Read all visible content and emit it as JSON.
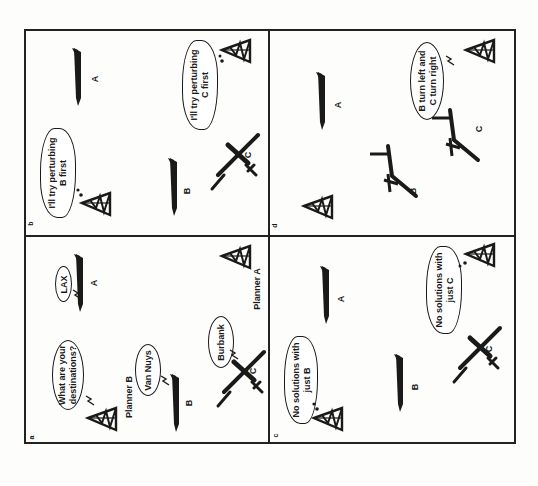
{
  "figure": {
    "orientation": "rotated 90 degrees counter-clockwise",
    "panels": [
      {
        "id": "a",
        "letter": "a",
        "aircraft": [
          {
            "label": "A",
            "pose": "side"
          },
          {
            "label": "B",
            "pose": "side"
          },
          {
            "label": "C",
            "pose": "top"
          }
        ],
        "planners": [
          {
            "label": "Planner B"
          },
          {
            "label": "Planner A"
          }
        ],
        "bubbles": [
          {
            "speaker": "Planner B",
            "text_line1": "What are your",
            "text_line2": "destinations?",
            "shape": "oval"
          },
          {
            "speaker": "A",
            "text_line1": "LAX",
            "shape": "oval"
          },
          {
            "speaker": "B",
            "text_line1": "Van Nuys",
            "shape": "oval"
          },
          {
            "speaker": "C",
            "text_line1": "Burbank",
            "shape": "oval"
          }
        ]
      },
      {
        "id": "b",
        "letter": "b",
        "aircraft": [
          {
            "label": "A",
            "pose": "side"
          },
          {
            "label": "B",
            "pose": "side"
          },
          {
            "label": "C",
            "pose": "top"
          }
        ],
        "bubbles": [
          {
            "speaker": "left planner",
            "text_line1": "I'll try perturbing",
            "text_line2": "B first",
            "shape": "thought"
          },
          {
            "speaker": "right planner",
            "text_line1": "I'll try perturbing",
            "text_line2": "C first",
            "shape": "thought"
          }
        ]
      },
      {
        "id": "c",
        "letter": "c",
        "aircraft": [
          {
            "label": "A",
            "pose": "side"
          },
          {
            "label": "B",
            "pose": "side"
          },
          {
            "label": "C",
            "pose": "top"
          }
        ],
        "bubbles": [
          {
            "speaker": "left planner",
            "text_line1": "No solutions with",
            "text_line2": "just B",
            "shape": "thought"
          },
          {
            "speaker": "right planner",
            "text_line1": "No solutions with",
            "text_line2": "just C",
            "shape": "thought"
          }
        ]
      },
      {
        "id": "d",
        "letter": "d",
        "aircraft": [
          {
            "label": "A",
            "pose": "side"
          },
          {
            "label": "B",
            "pose": "top-turning"
          },
          {
            "label": "C",
            "pose": "top-turning"
          }
        ],
        "bubbles": [
          {
            "speaker": "right planner",
            "text_line1": "B turn left and",
            "text_line2": "C turn right",
            "shape": "oval"
          }
        ]
      }
    ],
    "icons": {
      "planner": "radio-tower-icon",
      "aircraft_side": "airliner-side-icon",
      "aircraft_top": "airliner-top-icon",
      "transmission": "lightning-bolt-icon",
      "thought": "thought-dots-icon"
    },
    "colors": {
      "ink": "#1a1a1a",
      "paper": "#fdfdfb"
    }
  }
}
